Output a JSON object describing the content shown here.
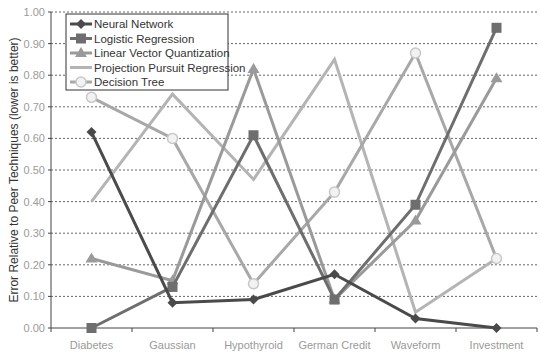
{
  "chart_data": {
    "type": "line",
    "title": "",
    "xlabel": "",
    "ylabel": "Error Relative to Peer Techniques (lower is better)",
    "ylim": [
      0,
      1.0
    ],
    "yticks": [
      "0.00",
      "0.10",
      "0.20",
      "0.30",
      "0.40",
      "0.50",
      "0.60",
      "0.70",
      "0.80",
      "0.90",
      "1.00"
    ],
    "grid": "horizontal dashed",
    "legend_position": "upper left",
    "categories": [
      "Diabetes",
      "Gaussian",
      "Hypothyroid",
      "German Credit",
      "Waveform",
      "Investment"
    ],
    "series": [
      {
        "name": "Neural Network",
        "marker": "diamond",
        "color": "#4a4a4a",
        "values": [
          0.62,
          0.08,
          0.09,
          0.17,
          0.03,
          0.0
        ]
      },
      {
        "name": "Logistic Regression",
        "marker": "square",
        "color": "#6e6e6e",
        "values": [
          0.0,
          0.13,
          0.61,
          0.09,
          0.39,
          0.95
        ]
      },
      {
        "name": "Linear Vector Quantization",
        "marker": "triangle",
        "color": "#9a9a9a",
        "values": [
          0.22,
          0.15,
          0.82,
          0.09,
          0.34,
          0.79
        ]
      },
      {
        "name": "Projection Pursuit Regression",
        "marker": "none",
        "color": "#b4b4b4",
        "values": [
          0.4,
          0.74,
          0.47,
          0.85,
          0.05,
          0.22
        ]
      },
      {
        "name": "Decision Tree",
        "marker": "circle",
        "color": "#a8a8a8",
        "values": [
          0.73,
          0.6,
          0.14,
          0.43,
          0.87,
          0.22
        ]
      }
    ]
  }
}
